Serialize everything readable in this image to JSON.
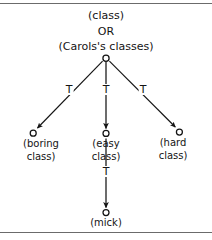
{
  "figure": {
    "type": "directed-graph",
    "title_lines": [
      "(class)",
      "OR",
      "(Carols's classes)"
    ],
    "root": {
      "id": "root",
      "label": "(Carols's classes)",
      "shape": "circle-open"
    },
    "nodes": [
      {
        "id": "boring",
        "label_lines": [
          "(boring",
          "class)"
        ],
        "shape": "circle-open"
      },
      {
        "id": "easy",
        "label_lines": [
          "(easy",
          "class)"
        ],
        "shape": "circle-open"
      },
      {
        "id": "hard",
        "label_lines": [
          "(hard",
          "class)"
        ],
        "shape": "circle-open"
      },
      {
        "id": "mick",
        "label_lines": [
          "(mick)"
        ],
        "shape": "circle-open"
      }
    ],
    "edges": [
      {
        "from": "root",
        "to": "boring",
        "label": "T"
      },
      {
        "from": "root",
        "to": "easy",
        "label": "T"
      },
      {
        "from": "root",
        "to": "hard",
        "label": "T"
      },
      {
        "from": "easy",
        "to": "mick",
        "label": "T"
      }
    ],
    "colors": {
      "ink": "#141414",
      "rule": "#6b6b6b",
      "background": "#ffffff"
    }
  }
}
